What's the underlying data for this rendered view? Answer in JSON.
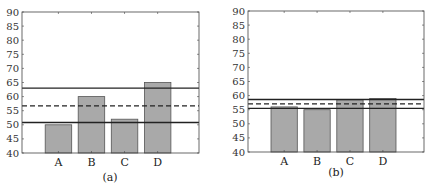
{
  "chart_data": [
    {
      "type": "bar",
      "caption": "(a)",
      "categories": [
        "A",
        "B",
        "C",
        "D"
      ],
      "values": [
        50,
        60,
        52,
        65
      ],
      "ylim": [
        40,
        90
      ],
      "yticks": [
        40,
        45,
        50,
        55,
        60,
        65,
        70,
        75,
        80,
        85,
        90
      ],
      "grid": false,
      "bar_color": "#a9a9a9",
      "reference_lines": [
        {
          "style": "solid",
          "value": 63
        },
        {
          "style": "dashed",
          "value": 56.7
        },
        {
          "style": "solid",
          "value": 50.8
        }
      ]
    },
    {
      "type": "bar",
      "caption": "(b)",
      "categories": [
        "A",
        "B",
        "C",
        "D"
      ],
      "values": [
        56,
        55,
        58.5,
        59
      ],
      "ylim": [
        40,
        90
      ],
      "yticks": [
        40,
        45,
        50,
        55,
        60,
        65,
        70,
        75,
        80,
        85,
        90
      ],
      "grid": false,
      "bar_color": "#a9a9a9",
      "reference_lines": [
        {
          "style": "solid",
          "value": 58.6
        },
        {
          "style": "dashed",
          "value": 57.1
        },
        {
          "style": "solid",
          "value": 55.5
        }
      ]
    }
  ]
}
